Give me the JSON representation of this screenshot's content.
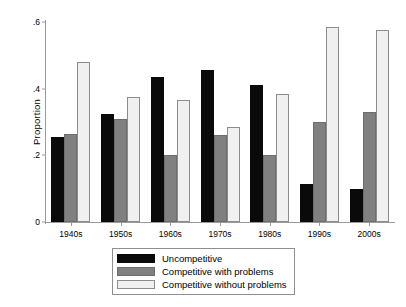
{
  "chart_data": {
    "type": "bar",
    "title": "",
    "xlabel": "",
    "ylabel": "Proportion",
    "categories": [
      "1940s",
      "1950s",
      "1960s",
      "1970s",
      "1980s",
      "1990s",
      "2000s"
    ],
    "series": [
      {
        "name": "Uncompetitive",
        "color": "#0a0a0a",
        "values": [
          0.255,
          0.325,
          0.435,
          0.455,
          0.41,
          0.115,
          0.1
        ]
      },
      {
        "name": "Competitive with problems",
        "color": "#808080",
        "values": [
          0.265,
          0.31,
          0.2,
          0.26,
          0.2,
          0.3,
          0.33
        ]
      },
      {
        "name": "Competitive without problems",
        "color": "#f0f0f0",
        "values": [
          0.48,
          0.375,
          0.365,
          0.285,
          0.385,
          0.585,
          0.575
        ]
      }
    ],
    "ylim": [
      0,
      0.6
    ],
    "yticks": [
      "0",
      ".2",
      ".4",
      ".6"
    ],
    "ytick_values": [
      0,
      0.2,
      0.4,
      0.6
    ],
    "grid": false,
    "legend_position": "bottom-center"
  }
}
